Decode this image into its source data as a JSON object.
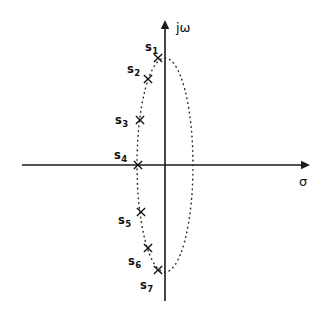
{
  "figure": {
    "background_color": "#ffffff",
    "ink_color": "#111111",
    "width": 325,
    "height": 313
  },
  "axes": {
    "origin": {
      "x": 165,
      "y": 165
    },
    "vertical": {
      "label": "jω",
      "label_symbol": "j-omega",
      "label_x": 176,
      "label_y": 32,
      "x": 165,
      "y_top": 20,
      "y_bottom": 301,
      "arrow": "up"
    },
    "horizontal": {
      "label": "σ",
      "label_symbol": "sigma",
      "label_x": 299,
      "label_y": 186,
      "y": 165,
      "x_left": 22,
      "x_right": 310,
      "arrow": "right"
    }
  },
  "locus": {
    "shape": "ellipse",
    "style": "dotted",
    "center_x": 165,
    "center_y": 165,
    "radius_x": 28,
    "radius_y": 107
  },
  "poles": [
    {
      "id": "s1",
      "label": "s",
      "subscript": "1",
      "marker": "x",
      "x": 158,
      "y": 58,
      "label_x": 145,
      "label_y": 51
    },
    {
      "id": "s2",
      "label": "s",
      "subscript": "2",
      "marker": "x",
      "x": 148,
      "y": 79,
      "label_x": 127,
      "label_y": 73
    },
    {
      "id": "s3",
      "label": "s",
      "subscript": "3",
      "marker": "x",
      "x": 140,
      "y": 120,
      "label_x": 115,
      "label_y": 124
    },
    {
      "id": "s4",
      "label": "s",
      "subscript": "4",
      "marker": "x",
      "x": 138,
      "y": 165,
      "label_x": 114,
      "label_y": 159
    },
    {
      "id": "s5",
      "label": "s",
      "subscript": "5",
      "marker": "x",
      "x": 141,
      "y": 212,
      "label_x": 118,
      "label_y": 224
    },
    {
      "id": "s6",
      "label": "s",
      "subscript": "6",
      "marker": "x",
      "x": 148,
      "y": 248,
      "label_x": 128,
      "label_y": 265
    },
    {
      "id": "s7",
      "label": "s",
      "subscript": "7",
      "marker": "x",
      "x": 158,
      "y": 270,
      "label_x": 140,
      "label_y": 289
    }
  ],
  "chart_data": {
    "type": "scatter",
    "title": "",
    "xlabel": "σ",
    "ylabel": "jω",
    "grid": false,
    "legend": "none",
    "xlim": [
      -143,
      145
    ],
    "ylim": [
      -136,
      145
    ],
    "annotations": [
      "Dotted ellipse locus through all seven pole positions",
      "All seven poles lie on the left half (negative sigma) of the ellipse"
    ],
    "series": [
      {
        "name": "poles",
        "marker": "x",
        "point_labels": [
          "s1",
          "s2",
          "s3",
          "s4",
          "s5",
          "s6",
          "s7"
        ],
        "x": [
          -7,
          -17,
          -25,
          -27,
          -24,
          -17,
          -7
        ],
        "y": [
          107,
          86,
          45,
          0,
          -47,
          -83,
          -105
        ]
      }
    ],
    "curves": [
      {
        "name": "ellipse locus",
        "style": "dotted",
        "center": [
          0,
          0
        ],
        "semi_axis_x": 28,
        "semi_axis_y": 107
      }
    ]
  }
}
